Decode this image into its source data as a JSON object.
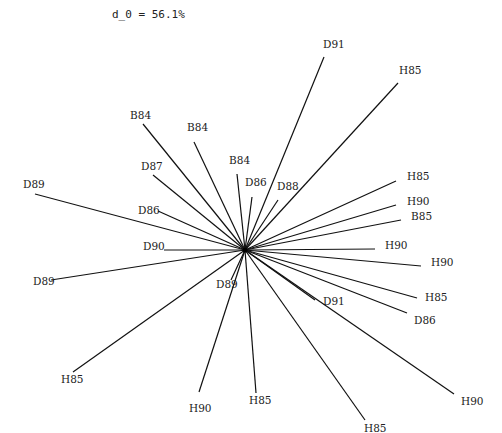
{
  "chart_data": {
    "type": "star",
    "title": "d_0 = 56.1%",
    "center": [
      245,
      250
    ],
    "rays": [
      {
        "label": "D91",
        "end": [
          324,
          57
        ],
        "label_pos": [
          323,
          48
        ]
      },
      {
        "label": "H85",
        "end": [
          398,
          83
        ],
        "label_pos": [
          399,
          74
        ]
      },
      {
        "label": "B84",
        "end": [
          143,
          124
        ],
        "label_pos": [
          130,
          119
        ]
      },
      {
        "label": "B84",
        "end": [
          194,
          142
        ],
        "label_pos": [
          187,
          131
        ]
      },
      {
        "label": "B84",
        "end": [
          237,
          174
        ],
        "label_pos": [
          229,
          164
        ]
      },
      {
        "label": "D87",
        "end": [
          153,
          175
        ],
        "label_pos": [
          141,
          170
        ]
      },
      {
        "label": "D86",
        "end": [
          252,
          197
        ],
        "label_pos": [
          245,
          186
        ]
      },
      {
        "label": "D88",
        "end": [
          278,
          200
        ],
        "label_pos": [
          277,
          190
        ]
      },
      {
        "label": "D89",
        "end": [
          35,
          194
        ],
        "label_pos": [
          23,
          188
        ]
      },
      {
        "label": "H85",
        "end": [
          396,
          181
        ],
        "label_pos": [
          407,
          180
        ]
      },
      {
        "label": "H90",
        "end": [
          396,
          205
        ],
        "label_pos": [
          407,
          205
        ]
      },
      {
        "label": "B85",
        "end": [
          401,
          220
        ],
        "label_pos": [
          411,
          220
        ]
      },
      {
        "label": "D86",
        "end": [
          158,
          211
        ],
        "label_pos": [
          138,
          214
        ]
      },
      {
        "label": "D90",
        "end": [
          164,
          250
        ],
        "label_pos": [
          143,
          250
        ]
      },
      {
        "label": "H90",
        "end": [
          375,
          249
        ],
        "label_pos": [
          385,
          249
        ]
      },
      {
        "label": "H90",
        "end": [
          421,
          266
        ],
        "label_pos": [
          431,
          266
        ]
      },
      {
        "label": "D89",
        "end": [
          51,
          280
        ],
        "label_pos": [
          33,
          285
        ]
      },
      {
        "label": "D89",
        "end": [
          231,
          280
        ],
        "label_pos": [
          216,
          288
        ]
      },
      {
        "label": "D91",
        "end": [
          315,
          300
        ],
        "label_pos": [
          323,
          305
        ]
      },
      {
        "label": "H85",
        "end": [
          417,
          298
        ],
        "label_pos": [
          425,
          301
        ]
      },
      {
        "label": "D86",
        "end": [
          407,
          313
        ],
        "label_pos": [
          414,
          324
        ]
      },
      {
        "label": "H85",
        "end": [
          73,
          372
        ],
        "label_pos": [
          61,
          383
        ]
      },
      {
        "label": "H90",
        "end": [
          199,
          392
        ],
        "label_pos": [
          189,
          412
        ]
      },
      {
        "label": "H85",
        "end": [
          256,
          393
        ],
        "label_pos": [
          249,
          404
        ]
      },
      {
        "label": "H85",
        "end": [
          365,
          420
        ],
        "label_pos": [
          364,
          432
        ]
      },
      {
        "label": "H90",
        "end": [
          454,
          394
        ],
        "label_pos": [
          461,
          405
        ]
      }
    ]
  }
}
